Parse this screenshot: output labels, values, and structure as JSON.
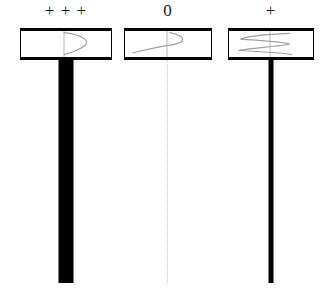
{
  "figure": {
    "width": 327,
    "height": 297,
    "background_color": "#ffffff",
    "stroke_color": "#000000",
    "curve_color": "#a0a0a0",
    "faint_color": "#c8c8c8"
  },
  "panels": [
    {
      "id": "panel-strong",
      "label": "+ + +",
      "label_meaning": "strong positive",
      "curve_name": "d-shaped-bulge-right",
      "curve_description": "single smooth lobe bulging to the right of the centre axis",
      "box": {
        "left": 20,
        "top": 28,
        "width": 92,
        "height": 32
      },
      "stem": {
        "style": "thick-solid-black",
        "width": 15,
        "height": 225,
        "top": 58
      }
    },
    {
      "id": "panel-zero",
      "label": "0",
      "label_meaning": "zero",
      "curve_name": "s-shaped-sigmoid",
      "curve_description": "s-shaped curve crossing the centre axis once",
      "box": {
        "left": 124,
        "top": 28,
        "width": 88,
        "height": 32
      },
      "stem": {
        "style": "thin-dotted-grey",
        "width": 1,
        "height": 223,
        "top": 60
      }
    },
    {
      "id": "panel-weak",
      "label": "+",
      "label_meaning": "weak positive",
      "curve_name": "zigzag-oscillation",
      "curve_description": "zigzag oscillating curve crossing the centre axis several times",
      "box": {
        "left": 228,
        "top": 28,
        "width": 86,
        "height": 32
      },
      "stem": {
        "style": "medium-solid-black",
        "width": 5,
        "height": 225,
        "top": 58
      }
    }
  ]
}
